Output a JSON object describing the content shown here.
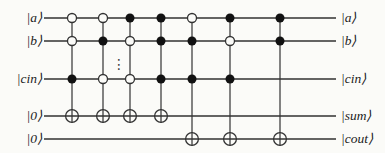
{
  "figure": {
    "type": "quantum-circuit",
    "background_color": "#fbfbf8",
    "wire_color": "#323232",
    "dot_color": "#111111",
    "open_dot_fill": "#fbfbf8",
    "canvas": {
      "width": 385,
      "height": 153
    },
    "wire_x_start": 44,
    "wire_x_end": 336,
    "wires": [
      {
        "id": "a",
        "label_left": "|a⟩",
        "label_right": "|a⟩",
        "y": 18
      },
      {
        "id": "b",
        "label_left": "|b⟩",
        "label_right": "|b⟩",
        "y": 41
      },
      {
        "id": "cin",
        "label_left": "|cin⟩",
        "label_right": "|cin⟩",
        "y": 79
      },
      {
        "id": "sum",
        "label_left": "|0⟩",
        "label_right": "|sum⟩",
        "y": 116
      },
      {
        "id": "cout",
        "label_left": "|0⟩",
        "label_right": "|cout⟩",
        "y": 139
      }
    ],
    "gates": [
      {
        "x": 72,
        "target_wire": "sum",
        "controls": [
          {
            "wire": "a",
            "state": "open"
          },
          {
            "wire": "b",
            "state": "open"
          },
          {
            "wire": "cin",
            "state": "filled"
          }
        ]
      },
      {
        "x": 103,
        "target_wire": "sum",
        "controls": [
          {
            "wire": "a",
            "state": "open"
          },
          {
            "wire": "b",
            "state": "filled"
          },
          {
            "wire": "cin",
            "state": "open"
          }
        ]
      },
      {
        "x": 130,
        "target_wire": "sum",
        "controls": [
          {
            "wire": "a",
            "state": "filled"
          },
          {
            "wire": "b",
            "state": "open"
          },
          {
            "wire": "cin",
            "state": "open"
          }
        ]
      },
      {
        "x": 161,
        "target_wire": "sum",
        "controls": [
          {
            "wire": "a",
            "state": "filled"
          },
          {
            "wire": "b",
            "state": "filled"
          },
          {
            "wire": "cin",
            "state": "filled"
          }
        ]
      },
      {
        "x": 192,
        "target_wire": "cout",
        "controls": [
          {
            "wire": "a",
            "state": "open"
          },
          {
            "wire": "b",
            "state": "filled"
          },
          {
            "wire": "cin",
            "state": "filled"
          }
        ]
      },
      {
        "x": 230,
        "target_wire": "cout",
        "controls": [
          {
            "wire": "a",
            "state": "filled"
          },
          {
            "wire": "b",
            "state": "open"
          },
          {
            "wire": "cin",
            "state": "filled"
          }
        ]
      },
      {
        "x": 280,
        "target_wire": "cout",
        "controls": [
          {
            "wire": "a",
            "state": "filled"
          },
          {
            "wire": "b",
            "state": "filled"
          }
        ]
      }
    ],
    "ellipsis": {
      "glyph": "⋮",
      "x": 115,
      "y": 64
    },
    "geometry": {
      "control_radius": 4.5,
      "target_radius": 6.4,
      "wire_stroke": 1.3,
      "gate_stroke": 1.2
    }
  }
}
